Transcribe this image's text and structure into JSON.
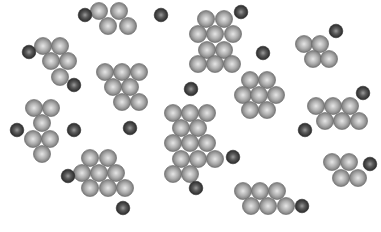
{
  "legend": {
    "large_particle": {
      "label": "cluster particle",
      "color": "#9a9a9a",
      "highlight": "#e6e6e6",
      "edge": "#6e6e6e"
    },
    "small_particle": {
      "label": "free particle",
      "color": "#4a4a4a",
      "highlight": "#9a9a9a",
      "edge": "#2a2a2a"
    }
  },
  "clusters": [
    {
      "id": "c1",
      "particles": [
        [
          99,
          11
        ],
        [
          119,
          11
        ],
        [
          108,
          26
        ],
        [
          128,
          26
        ]
      ]
    },
    {
      "id": "c2",
      "particles": [
        [
          43,
          46
        ],
        [
          60,
          46
        ],
        [
          51,
          61
        ],
        [
          68,
          61
        ],
        [
          60,
          77
        ]
      ]
    },
    {
      "id": "c3",
      "particles": [
        [
          105,
          72
        ],
        [
          122,
          72
        ],
        [
          139,
          72
        ],
        [
          113,
          87
        ],
        [
          130,
          87
        ],
        [
          122,
          102
        ],
        [
          139,
          102
        ]
      ]
    },
    {
      "id": "c4",
      "particles": [
        [
          206,
          19
        ],
        [
          224,
          19
        ],
        [
          198,
          34
        ],
        [
          215,
          34
        ],
        [
          233,
          34
        ],
        [
          207,
          50
        ],
        [
          224,
          50
        ],
        [
          198,
          64
        ],
        [
          215,
          64
        ],
        [
          232,
          64
        ]
      ]
    },
    {
      "id": "c5",
      "particles": [
        [
          304,
          44
        ],
        [
          320,
          44
        ],
        [
          313,
          59
        ],
        [
          329,
          59
        ]
      ]
    },
    {
      "id": "c6",
      "particles": [
        [
          250,
          80
        ],
        [
          267,
          80
        ],
        [
          243,
          95
        ],
        [
          259,
          95
        ],
        [
          276,
          95
        ],
        [
          250,
          110
        ],
        [
          267,
          110
        ]
      ]
    },
    {
      "id": "c7",
      "particles": [
        [
          316,
          106
        ],
        [
          333,
          106
        ],
        [
          350,
          106
        ],
        [
          325,
          121
        ],
        [
          342,
          121
        ],
        [
          359,
          121
        ]
      ]
    },
    {
      "id": "c8",
      "particles": [
        [
          34,
          108
        ],
        [
          51,
          108
        ],
        [
          42,
          123
        ],
        [
          33,
          139
        ],
        [
          50,
          139
        ],
        [
          42,
          154
        ]
      ]
    },
    {
      "id": "c9",
      "particles": [
        [
          173,
          113
        ],
        [
          190,
          113
        ],
        [
          207,
          113
        ],
        [
          181,
          128
        ],
        [
          198,
          128
        ],
        [
          173,
          143
        ],
        [
          190,
          143
        ],
        [
          207,
          143
        ],
        [
          181,
          159
        ],
        [
          198,
          159
        ],
        [
          215,
          159
        ],
        [
          173,
          174
        ],
        [
          190,
          174
        ]
      ]
    },
    {
      "id": "c10",
      "particles": [
        [
          90,
          158
        ],
        [
          108,
          158
        ],
        [
          82,
          173
        ],
        [
          99,
          173
        ],
        [
          116,
          173
        ],
        [
          90,
          188
        ],
        [
          108,
          188
        ],
        [
          125,
          188
        ]
      ]
    },
    {
      "id": "c11",
      "particles": [
        [
          332,
          162
        ],
        [
          349,
          162
        ],
        [
          341,
          178
        ],
        [
          358,
          178
        ]
      ]
    },
    {
      "id": "c12",
      "particles": [
        [
          243,
          191
        ],
        [
          260,
          191
        ],
        [
          277,
          191
        ],
        [
          251,
          206
        ],
        [
          268,
          206
        ],
        [
          286,
          206
        ]
      ]
    }
  ],
  "free_particles": [
    [
      85,
      15
    ],
    [
      161,
      15
    ],
    [
      241,
      12
    ],
    [
      29,
      52
    ],
    [
      74,
      85
    ],
    [
      263,
      53
    ],
    [
      336,
      31
    ],
    [
      191,
      89
    ],
    [
      363,
      93
    ],
    [
      17,
      130
    ],
    [
      74,
      130
    ],
    [
      130,
      128
    ],
    [
      305,
      130
    ],
    [
      233,
      157
    ],
    [
      68,
      176
    ],
    [
      196,
      188
    ],
    [
      123,
      208
    ],
    [
      302,
      206
    ],
    [
      370,
      164
    ]
  ]
}
